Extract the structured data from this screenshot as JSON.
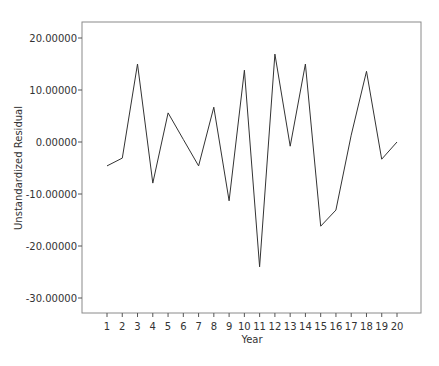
{
  "chart_data": {
    "type": "line",
    "title": "",
    "xlabel": "Year",
    "ylabel": "Unstandardized Residual",
    "x": [
      1,
      2,
      3,
      4,
      5,
      6,
      7,
      8,
      9,
      10,
      11,
      12,
      13,
      14,
      15,
      16,
      17,
      18,
      19,
      20
    ],
    "categories": [
      "1",
      "2",
      "3",
      "4",
      "5",
      "6",
      "7",
      "8",
      "9",
      "10",
      "11",
      "12",
      "13",
      "14",
      "15",
      "16",
      "17",
      "18",
      "19",
      "20"
    ],
    "series": [
      {
        "name": "Unstandardized Residual",
        "values": [
          -4.6,
          -3.1,
          15.0,
          -7.9,
          5.6,
          0.5,
          -4.6,
          6.7,
          -11.3,
          13.8,
          -24.0,
          16.9,
          -0.8,
          15.0,
          -16.2,
          -13.1,
          1.3,
          13.6,
          -3.3,
          0.0
        ]
      }
    ],
    "yticks": [
      20,
      10,
      0,
      -10,
      -20,
      -30
    ],
    "ytick_labels": [
      "20.00000",
      "10.00000",
      "0.00000",
      "-10.00000",
      "-20.00000",
      "-30.00000"
    ],
    "ylim": [
      -32.9,
      22.9
    ],
    "xlim": [
      0.3,
      21.7
    ],
    "grid": false,
    "legend": "none",
    "colors": {
      "line": "#333333",
      "frame": "#888888"
    }
  }
}
